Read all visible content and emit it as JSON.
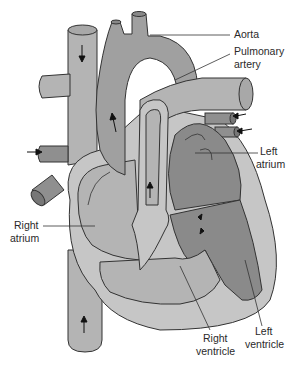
{
  "labels": {
    "aorta": "Aorta",
    "pulmonary_artery_1": "Pulmonary",
    "pulmonary_artery_2": "artery",
    "left_atrium_1": "Left",
    "left_atrium_2": "atrium",
    "right_atrium_1": "Right",
    "right_atrium_2": "atrium",
    "right_ventricle_1": "Right",
    "right_ventricle_2": "ventricle",
    "left_ventricle_1": "Left",
    "left_ventricle_2": "ventricle"
  },
  "colors": {
    "light_gray": "#b4b4b4",
    "mid_gray": "#a0a0a0",
    "dark_gray": "#8a8a8a",
    "pale_gray": "#c6c6c6",
    "outline": "#333333"
  },
  "flow_arrows": [
    {
      "location": "superior-vena-cava",
      "direction": "down"
    },
    {
      "location": "aorta",
      "direction": "up"
    },
    {
      "location": "septum-channel",
      "direction": "up"
    },
    {
      "location": "inferior-vena-cava",
      "direction": "up"
    },
    {
      "location": "pulmonary-veins",
      "direction": "left"
    },
    {
      "location": "left-vein-inlet",
      "direction": "right"
    },
    {
      "location": "valve",
      "direction": "bidirectional"
    }
  ]
}
